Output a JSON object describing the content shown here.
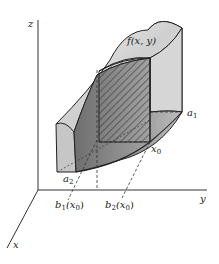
{
  "figure": {
    "labels": {
      "z_axis": "z",
      "y_axis": "y",
      "x_axis": "x",
      "surface": "f(x, y)",
      "a1": "a",
      "a1_sub": "1",
      "a2": "a",
      "a2_sub": "2",
      "x0": "x",
      "x0_sub": "0",
      "b1": "b",
      "b1_sub": "1",
      "b1_arg": "(x",
      "b1_arg_sub": "0",
      "b1_close": ")",
      "b2": "b",
      "b2_sub": "2",
      "b2_arg": "(x",
      "b2_arg_sub": "0",
      "b2_close": ")"
    },
    "colors": {
      "line": "#222222",
      "top_surface": "#d8d8d8",
      "front_face": "#8a8a8a",
      "side_face": "#c4c4c4",
      "back_face": "#e2e2e2"
    }
  }
}
